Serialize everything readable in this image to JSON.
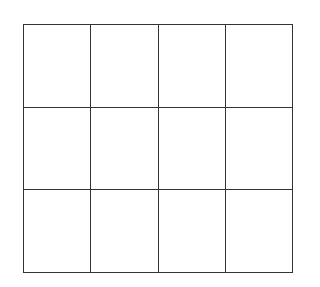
{
  "grid": {
    "rows": 3,
    "columns": 4,
    "line_color": "#333333",
    "background": "#ffffff",
    "cells": [
      [
        "",
        "",
        "",
        ""
      ],
      [
        "",
        "",
        "",
        ""
      ],
      [
        "",
        "",
        "",
        ""
      ]
    ]
  }
}
